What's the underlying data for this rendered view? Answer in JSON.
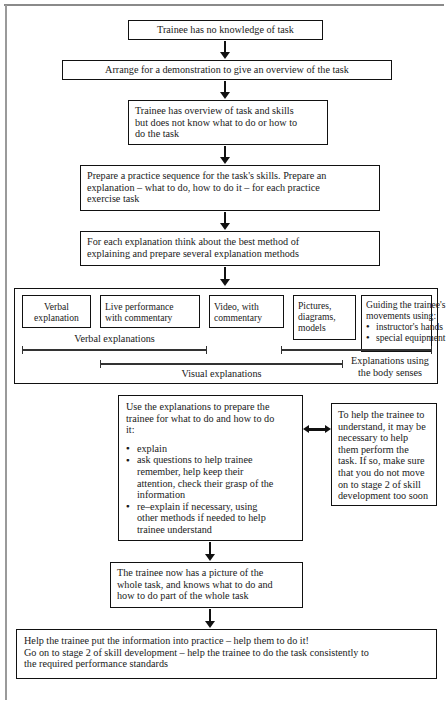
{
  "diagram": {
    "nodes": {
      "trainee_no_knowledge": "Trainee has no knowledge of task",
      "arrange_demonstration": "Arrange for a demonstration to give an overview of the task",
      "trainee_overview": {
        "line1": "Trainee has overview of task and skills",
        "line2": "but does not know what to do or how to",
        "line3": "do the task"
      },
      "prepare_practice": {
        "line1": "Prepare a practice sequence for the task's skills. Prepare an",
        "line2": "explanation – what to do, how to do it – for each practice",
        "line3": "exercise task"
      },
      "think_best_method": {
        "line1": "For each explanation think about the best method of",
        "line2": "explaining and prepare several explanation methods"
      },
      "use_explanations": {
        "intro1": "Use the explanations to prepare the",
        "intro2": "trainee for what to do and how to do",
        "intro3": "it:",
        "bullets": [
          [
            "explain"
          ],
          [
            "ask questions to help trainee",
            "remember, help keep their",
            "attention, check their grasp of the",
            "information"
          ],
          [
            "re–explain if necessary, using",
            "other methods if needed to help",
            "trainee understand"
          ]
        ]
      },
      "help_perform": {
        "line1": "To help the trainee to",
        "line2": "understand, it may be",
        "line3": "necessary to help",
        "line4": "them perform the",
        "line5": "task. If so, make sure",
        "line6": "that you do not move",
        "line7": "on to stage 2 of skill",
        "line8": "development too soon"
      },
      "trainee_picture": {
        "line1": "The trainee now has a picture of the",
        "line2": "whole task, and knows what to do and",
        "line3": "how to do part of the whole task"
      },
      "final_outcome": {
        "line1": "Help the trainee put the information into practice – help them to do it!",
        "line2": "Go on to stage 2 of skill development – help the trainee to do the task consistently to",
        "line3": "the required performance standards"
      }
    },
    "methods": [
      {
        "id": "verbal-explanation",
        "lines": [
          "Verbal",
          "explanation"
        ],
        "bullets": []
      },
      {
        "id": "live-performance",
        "lines": [
          "Live performance",
          "with commentary"
        ],
        "bullets": []
      },
      {
        "id": "video-commentary",
        "lines": [
          "Video, with",
          "commentary"
        ],
        "bullets": []
      },
      {
        "id": "pictures-diagrams-models",
        "lines": [
          "Pictures,",
          "diagrams,",
          "models"
        ],
        "bullets": []
      },
      {
        "id": "guiding-movements",
        "lines": [
          "Guiding the trainee's",
          "movements using:"
        ],
        "bullets": [
          "instructor's hands",
          "special equipment"
        ]
      }
    ],
    "spans": [
      {
        "id": "verbal-explanations",
        "label_lines": [
          "Verbal explanations"
        ]
      },
      {
        "id": "visual-explanations",
        "label_lines": [
          "Visual explanations"
        ]
      },
      {
        "id": "body-senses",
        "label_lines": [
          "Explanations using",
          "the body senses"
        ]
      }
    ],
    "colors": {
      "ink": "#111111",
      "frame": "#8a8a8a",
      "paper": "#ffffff"
    }
  }
}
